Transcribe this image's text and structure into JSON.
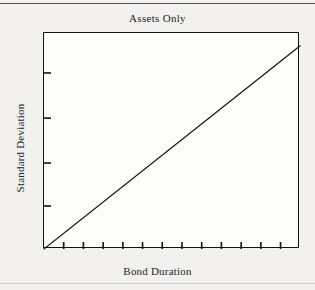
{
  "figure": {
    "background_color": "#f2f1ef",
    "rule_color": "#555452",
    "top_rule": "horizontal-rule",
    "bottom_rule": "horizontal-rule"
  },
  "chart_data": {
    "type": "line",
    "title": "Assets Only",
    "subtitle": "",
    "xlabel": "Bond Duration",
    "ylabel": "Standard Deviation",
    "grid": false,
    "legend": null,
    "legend_position": "none",
    "line_color": "#111111",
    "frame_color": "#111111",
    "plot_background": "#fdfdfc",
    "xlim": [
      0,
      1
    ],
    "ylim": [
      0,
      1
    ],
    "x_tick_labels": [],
    "y_tick_labels": [],
    "x_tick_count": 12,
    "y_tick_count": 4,
    "x_ticks": [
      0.077,
      0.154,
      0.231,
      0.308,
      0.385,
      0.462,
      0.539,
      0.616,
      0.693,
      0.77,
      0.847,
      0.924
    ],
    "y_ticks": [
      0.199,
      0.398,
      0.606,
      0.815
    ],
    "series": [
      {
        "name": "Assets Only",
        "x": [
          0,
          1
        ],
        "values": [
          0,
          0.94
        ],
        "description": "straight upward sloping line from origin"
      }
    ],
    "annotations": []
  }
}
